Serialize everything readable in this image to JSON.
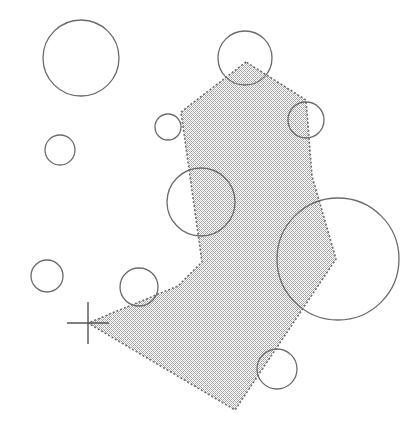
{
  "figure": {
    "width": 418,
    "height": 440,
    "background_color": "#ffffff"
  },
  "chart_data": {
    "type": "scatter",
    "title": "",
    "xlabel": "",
    "ylabel": "",
    "xlim": [
      0,
      418
    ],
    "ylim": [
      0,
      440
    ],
    "grid": false,
    "legend": null,
    "annotations": [],
    "shapes": {
      "polygon": {
        "name": "shaded-region",
        "fill_color": "#c9c9c9",
        "fill_pattern": "halftone-dither",
        "stroke_color": "#6e6e6e",
        "stroke_style": "dotted",
        "stroke_width": 1.6,
        "vertices": [
          [
            246,
            62
          ],
          [
            181,
            112
          ],
          [
            202,
            262
          ],
          [
            178,
            286
          ],
          [
            88,
            323
          ],
          [
            235,
            410
          ],
          [
            336,
            259
          ],
          [
            312,
            176
          ],
          [
            306,
            100
          ]
        ]
      },
      "marker": {
        "name": "origin-cross",
        "type": "cross",
        "center": [
          88,
          323
        ],
        "arm_length_x": 21,
        "arm_length_y": 21,
        "stroke_color": "#555555",
        "stroke_width": 1.4
      },
      "circles": [
        {
          "id": "c1",
          "cx": 81,
          "cy": 58,
          "r": 38,
          "stroke_color": "#6b6b6b",
          "fill": "none"
        },
        {
          "id": "c2",
          "cx": 60,
          "cy": 150,
          "r": 15,
          "stroke_color": "#6b6b6b",
          "fill": "none"
        },
        {
          "id": "c3",
          "cx": 47,
          "cy": 276,
          "r": 16,
          "stroke_color": "#6b6b6b",
          "fill": "none"
        },
        {
          "id": "c4",
          "cx": 245,
          "cy": 58,
          "r": 27,
          "stroke_color": "#6b6b6b",
          "fill": "none"
        },
        {
          "id": "c5",
          "cx": 168,
          "cy": 127,
          "r": 13,
          "stroke_color": "#6b6b6b",
          "fill": "none"
        },
        {
          "id": "c6",
          "cx": 306,
          "cy": 120,
          "r": 18,
          "stroke_color": "#6b6b6b",
          "fill": "none"
        },
        {
          "id": "c7",
          "cx": 201,
          "cy": 202,
          "r": 34,
          "stroke_color": "#6b6b6b",
          "fill": "none"
        },
        {
          "id": "c8",
          "cx": 338,
          "cy": 259,
          "r": 61,
          "stroke_color": "#6b6b6b",
          "fill": "none"
        },
        {
          "id": "c9",
          "cx": 139,
          "cy": 287,
          "r": 19,
          "stroke_color": "#6b6b6b",
          "fill": "none"
        },
        {
          "id": "c10",
          "cx": 277,
          "cy": 369,
          "r": 20,
          "stroke_color": "#6b6b6b",
          "fill": "none"
        }
      ]
    },
    "counts": {
      "circle_count": 10,
      "polygon_vertex_count": 9,
      "marker_count": 1
    }
  }
}
